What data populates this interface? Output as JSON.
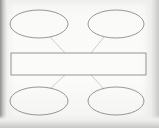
{
  "document": {
    "kind": "scanned-worksheet",
    "title": "Blank concept map graphic organizer",
    "page_background": "#fbfbfa",
    "ink_color": "#8a8a8a",
    "connector_color": "#b9b9b7",
    "shadow_color": "#8f8f8f"
  },
  "diagram": {
    "type": "concept-map",
    "center": {
      "shape": "rectangle",
      "label": "",
      "x": 11,
      "y": 53,
      "width": 135,
      "height": 22,
      "stroke": "#8a8a8a",
      "fill": "#ffffff"
    },
    "nodes": [
      {
        "id": "top-left",
        "shape": "ellipse",
        "label": "",
        "cx": 39,
        "cy": 24,
        "rx": 29,
        "ry": 14,
        "stroke": "#8a8a8a",
        "fill": "#ffffff"
      },
      {
        "id": "top-right",
        "shape": "ellipse",
        "label": "",
        "cx": 116,
        "cy": 24,
        "rx": 28,
        "ry": 14,
        "stroke": "#8a8a8a",
        "fill": "#ffffff"
      },
      {
        "id": "bottom-left",
        "shape": "ellipse",
        "label": "",
        "cx": 39,
        "cy": 101,
        "rx": 29,
        "ry": 14,
        "stroke": "#8a8a8a",
        "fill": "#ffffff"
      },
      {
        "id": "bottom-right",
        "shape": "ellipse",
        "label": "",
        "cx": 116,
        "cy": 101,
        "rx": 28,
        "ry": 14,
        "stroke": "#8a8a8a",
        "fill": "#ffffff"
      }
    ],
    "connectors": [
      {
        "id": "top-left-to-center",
        "from": "top-left",
        "to": "center",
        "x1": 50,
        "y1": 37,
        "x2": 65,
        "y2": 53
      },
      {
        "id": "top-right-to-center",
        "from": "top-right",
        "to": "center",
        "x1": 104,
        "y1": 37,
        "x2": 91,
        "y2": 53
      },
      {
        "id": "center-to-bottom-left",
        "from": "center",
        "to": "bottom-left",
        "x1": 65,
        "y1": 75,
        "x2": 50,
        "y2": 89
      },
      {
        "id": "center-to-bottom-right",
        "from": "center",
        "to": "bottom-right",
        "x1": 91,
        "y1": 75,
        "x2": 104,
        "y2": 89
      }
    ]
  }
}
